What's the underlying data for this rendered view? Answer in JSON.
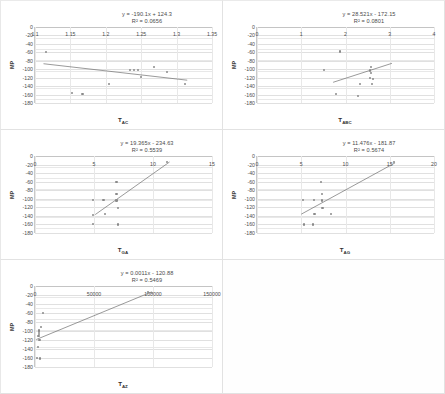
{
  "figure": {
    "layout": "2-column grid of scatter plots with linear trendlines, 5 panels, last cell empty",
    "panel_count": 5,
    "background_color": "#ffffff",
    "point_color": "#8a8a8a",
    "trendline_color": "#6f6f6f",
    "gridline_color": "#e0e0e0"
  },
  "chart_data": [
    {
      "id": "chart-tac",
      "type": "scatter",
      "title": "",
      "equation": "y = -190.1x + 124.3",
      "r_squared_label": "R² = 0.0656",
      "r_squared": 0.0656,
      "slope": -190.1,
      "intercept": 124.3,
      "xlabel": "T",
      "xlabel_sub": "AC",
      "ylabel": "MP",
      "xlim": [
        1.1,
        1.35
      ],
      "ylim": [
        -180,
        0
      ],
      "xticks": [
        "1.1",
        "1.15",
        "1.2",
        "1.25",
        "1.3",
        "1.35"
      ],
      "xtick_values": [
        1.1,
        1.15,
        1.2,
        1.25,
        1.3,
        1.35
      ],
      "yticks": [
        "0",
        "-20",
        "-40",
        "-60",
        "-80",
        "-100",
        "-120",
        "-140",
        "-160",
        "-180"
      ],
      "ytick_values": [
        0,
        -20,
        -40,
        -60,
        -80,
        -100,
        -120,
        -140,
        -160,
        -180
      ],
      "points": [
        {
          "x": 1.115,
          "y": -60
        },
        {
          "x": 1.152,
          "y": -157
        },
        {
          "x": 1.167,
          "y": -158
        },
        {
          "x": 1.205,
          "y": -135
        },
        {
          "x": 1.234,
          "y": -102
        },
        {
          "x": 1.24,
          "y": -102
        },
        {
          "x": 1.245,
          "y": -102
        },
        {
          "x": 1.25,
          "y": -119
        },
        {
          "x": 1.268,
          "y": -94
        },
        {
          "x": 1.287,
          "y": -107
        },
        {
          "x": 1.312,
          "y": -135
        }
      ],
      "trendline": {
        "x1": 1.112,
        "y1": -87,
        "x2": 1.315,
        "y2": -126
      }
    },
    {
      "id": "chart-tabc",
      "type": "scatter",
      "title": "",
      "equation": "y = 28.521x - 172.15",
      "r_squared_label": "R² = 0.0801",
      "r_squared": 0.0801,
      "slope": 28.521,
      "intercept": -172.15,
      "xlabel": "T",
      "xlabel_sub": "ABC",
      "ylabel": "MP",
      "xlim": [
        0,
        4
      ],
      "ylim": [
        -180,
        0
      ],
      "xticks": [
        "0",
        "1",
        "2",
        "3",
        "4"
      ],
      "xtick_values": [
        0,
        1,
        2,
        3,
        4
      ],
      "yticks": [
        "0",
        "-20",
        "-40",
        "-60",
        "-80",
        "-100",
        "-120",
        "-140",
        "-160",
        "-180"
      ],
      "ytick_values": [
        0,
        -20,
        -40,
        -60,
        -80,
        -100,
        -120,
        -140,
        -160,
        -180
      ],
      "points": [
        {
          "x": 1.52,
          "y": -102
        },
        {
          "x": 1.78,
          "y": -158
        },
        {
          "x": 1.88,
          "y": -58
        },
        {
          "x": 2.28,
          "y": -163
        },
        {
          "x": 2.33,
          "y": -135
        },
        {
          "x": 2.58,
          "y": -94
        },
        {
          "x": 2.56,
          "y": -103
        },
        {
          "x": 2.58,
          "y": -108
        },
        {
          "x": 2.55,
          "y": -120
        },
        {
          "x": 2.6,
          "y": -135
        },
        {
          "x": 2.62,
          "y": -124
        }
      ],
      "trendline": {
        "x1": 1.72,
        "y1": -131,
        "x2": 3.05,
        "y2": -86
      }
    },
    {
      "id": "chart-tga",
      "type": "scatter",
      "title": "",
      "equation": "y = 19.365x - 234.63",
      "r_squared_label": "R² = 0.5539",
      "r_squared": 0.5539,
      "slope": 19.365,
      "intercept": -234.63,
      "xlabel": "T",
      "xlabel_sub": "GA",
      "ylabel": "MP",
      "xlim": [
        0,
        15
      ],
      "ylim": [
        -180,
        0
      ],
      "xticks": [
        "0",
        "5",
        "10",
        "15"
      ],
      "xtick_values": [
        0,
        5,
        10,
        15
      ],
      "yticks": [
        "0",
        "-20",
        "-40",
        "-60",
        "-80",
        "-100",
        "-120",
        "-140",
        "-160",
        "-180"
      ],
      "ytick_values": [
        0,
        -20,
        -40,
        -60,
        -80,
        -100,
        -120,
        -140,
        -160,
        -180
      ],
      "points": [
        {
          "x": 4.9,
          "y": -102
        },
        {
          "x": 4.9,
          "y": -137
        },
        {
          "x": 4.9,
          "y": -159
        },
        {
          "x": 5.8,
          "y": -102
        },
        {
          "x": 5.9,
          "y": -135
        },
        {
          "x": 6.9,
          "y": -60
        },
        {
          "x": 6.9,
          "y": -88
        },
        {
          "x": 6.9,
          "y": -104
        },
        {
          "x": 7.0,
          "y": -122
        },
        {
          "x": 7.0,
          "y": -160
        },
        {
          "x": 11.2,
          "y": -14
        }
      ],
      "trendline": {
        "x1": 5.1,
        "y1": -137,
        "x2": 11.4,
        "y2": -14
      }
    },
    {
      "id": "chart-tag",
      "type": "scatter",
      "title": "",
      "equation": "y = 11.476x - 181.87",
      "r_squared_label": "R² = 0.5674",
      "r_squared": 0.5674,
      "slope": 11.476,
      "intercept": -181.87,
      "xlabel": "T",
      "xlabel_sub": "AG",
      "ylabel": "MP",
      "xlim": [
        0,
        20
      ],
      "ylim": [
        -180,
        0
      ],
      "xticks": [
        "0",
        "5",
        "10",
        "15",
        "20"
      ],
      "xtick_values": [
        0,
        5,
        10,
        15,
        20
      ],
      "yticks": [
        "0",
        "-20",
        "-40",
        "-60",
        "-80",
        "-100",
        "-120",
        "-140",
        "-160",
        "-180"
      ],
      "ytick_values": [
        0,
        -20,
        -40,
        -60,
        -80,
        -100,
        -120,
        -140,
        -160,
        -180
      ],
      "points": [
        {
          "x": 5.2,
          "y": -102
        },
        {
          "x": 5.3,
          "y": -160
        },
        {
          "x": 6.3,
          "y": -160
        },
        {
          "x": 6.4,
          "y": -102
        },
        {
          "x": 6.5,
          "y": -135
        },
        {
          "x": 7.2,
          "y": -60
        },
        {
          "x": 7.3,
          "y": -88
        },
        {
          "x": 7.3,
          "y": -104
        },
        {
          "x": 7.4,
          "y": -121
        },
        {
          "x": 8.4,
          "y": -135
        },
        {
          "x": 15.5,
          "y": -14
        }
      ],
      "trendline": {
        "x1": 5.0,
        "y1": -136,
        "x2": 15.6,
        "y2": -16
      }
    },
    {
      "id": "chart-taz",
      "type": "scatter",
      "title": "",
      "equation": "y = 0.0011x - 120.88",
      "r_squared_label": "R² = 0.5469",
      "r_squared": 0.5469,
      "slope": 0.0011,
      "intercept": -120.88,
      "xlabel": "T",
      "xlabel_sub": "AZ",
      "ylabel": "MP",
      "xlim": [
        0,
        150000
      ],
      "ylim": [
        -180,
        0
      ],
      "xticks": [
        "0",
        "50000",
        "100000",
        "150000"
      ],
      "xtick_values": [
        0,
        50000,
        100000,
        150000
      ],
      "yticks": [
        "0",
        "-20",
        "-40",
        "-60",
        "-80",
        "-100",
        "-120",
        "-140",
        "-160",
        "-180"
      ],
      "ytick_values": [
        0,
        -20,
        -40,
        -60,
        -80,
        -100,
        -120,
        -140,
        -160,
        -180
      ],
      "points": [
        {
          "x": 1500,
          "y": -160
        },
        {
          "x": 4200,
          "y": -161
        },
        {
          "x": 2500,
          "y": -136
        },
        {
          "x": 3800,
          "y": -120
        },
        {
          "x": 3000,
          "y": -112
        },
        {
          "x": 3200,
          "y": -106
        },
        {
          "x": 3400,
          "y": -102
        },
        {
          "x": 3600,
          "y": -99
        },
        {
          "x": 5000,
          "y": -92
        },
        {
          "x": 6500,
          "y": -60
        },
        {
          "x": 96000,
          "y": -14
        },
        {
          "x": 99000,
          "y": -16
        }
      ],
      "trendline": {
        "x1": 1000,
        "y1": -119,
        "x2": 99000,
        "y2": -13
      }
    }
  ]
}
